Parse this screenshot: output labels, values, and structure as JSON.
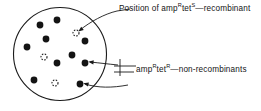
{
  "figure": {
    "type": "diagram",
    "colors": {
      "stroke": "#1a1a1a",
      "colony_fill": "#141414",
      "background": "#ffffff",
      "text": "#141414"
    },
    "plate": {
      "label": "agar-plate",
      "cx": 60,
      "cy": 54,
      "r": 46.5
    },
    "labels": {
      "recombinant": {
        "prefix": "Position of amp",
        "sup1": "R",
        "mid": "tet",
        "sup2": "S",
        "suffix": "—recombinant",
        "full_text": "Position of ampRtetS—recombinant"
      },
      "non_recombinant": {
        "prefix": "amp",
        "sup1": "R",
        "mid": "tet",
        "sup2": "R",
        "suffix": "—non-recombinants",
        "full_text": "ampRtetR—non-recombinants"
      }
    },
    "colonies": {
      "filled": [
        {
          "cx": 40,
          "cy": 25,
          "r": 3.4
        },
        {
          "cx": 57,
          "cy": 20,
          "r": 3.4
        },
        {
          "cx": 46,
          "cy": 39,
          "r": 3.4
        },
        {
          "cx": 27,
          "cy": 47,
          "r": 3.4
        },
        {
          "cx": 85,
          "cy": 41,
          "r": 3.4
        },
        {
          "cx": 72,
          "cy": 55,
          "r": 3.4
        },
        {
          "cx": 57,
          "cy": 63,
          "r": 3.4
        },
        {
          "cx": 85,
          "cy": 63,
          "r": 3.4
        },
        {
          "cx": 34,
          "cy": 80,
          "r": 3.4
        },
        {
          "cx": 80,
          "cy": 84,
          "r": 3.4
        }
      ],
      "open": [
        {
          "cx": 76,
          "cy": 33,
          "r": 3.0
        },
        {
          "cx": 44,
          "cy": 57,
          "r": 3.0
        },
        {
          "cx": 55,
          "cy": 83,
          "r": 3.0
        }
      ]
    },
    "arrows": [
      {
        "name": "arrow-to-recombinant",
        "path": "M 117 11 C 104 14, 90 22, 80 30",
        "head": [
          78.2,
          31.6
        ]
      },
      {
        "name": "arrow-to-nonrecombinant-upper",
        "path": "M 118 65 C 108 64, 100 63, 90 62",
        "head": [
          88.2,
          61.8
        ]
      },
      {
        "name": "arrow-to-nonrecombinant-lower",
        "path": "M 128 85 C 112 88, 98 88, 85 84",
        "head": [
          83.2,
          83.2
        ]
      }
    ],
    "leaders": [
      {
        "name": "leader-top",
        "x1": 117,
        "y1": 11,
        "x2": 130,
        "y2": 9
      },
      {
        "name": "leader-bottom-vertical",
        "x1": 120,
        "y1": 59,
        "x2": 120,
        "y2": 76
      },
      {
        "name": "leader-bottom-horizontal-upper",
        "x1": 114,
        "y1": 66,
        "x2": 136,
        "y2": 66
      },
      {
        "name": "leader-bottom-horizontal-lower",
        "x1": 114,
        "y1": 72,
        "x2": 134,
        "y2": 72
      }
    ]
  }
}
